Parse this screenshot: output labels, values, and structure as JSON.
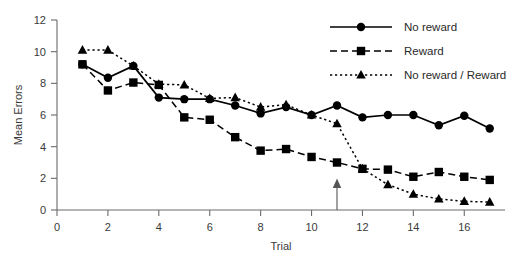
{
  "chart_data": {
    "type": "line",
    "title": "",
    "xlabel": "Trial",
    "ylabel": "Mean Errors",
    "xlim": [
      0,
      17.6
    ],
    "ylim": [
      0,
      12
    ],
    "xticks": [
      0,
      2,
      4,
      6,
      8,
      10,
      12,
      14,
      16
    ],
    "yticks": [
      0,
      2,
      4,
      6,
      8,
      10,
      12
    ],
    "xtick_labels": [
      "0",
      "2",
      "4",
      "6",
      "8",
      "10",
      "12",
      "14",
      "16"
    ],
    "ytick_labels": [
      "0",
      "2",
      "4",
      "6",
      "8",
      "10",
      "12"
    ],
    "grid": false,
    "legend_position": "top-right",
    "x": [
      1,
      2,
      3,
      4,
      5,
      6,
      7,
      8,
      9,
      10,
      11,
      12,
      13,
      14,
      15,
      16,
      17
    ],
    "series": [
      {
        "name": "No reward",
        "marker": "circle",
        "linestyle": "solid",
        "color": "#000000",
        "values": [
          9.2,
          8.35,
          9.1,
          7.1,
          7.0,
          7.0,
          6.6,
          6.1,
          6.5,
          6.0,
          6.6,
          5.85,
          6.0,
          6.0,
          5.35,
          5.95,
          5.15
        ]
      },
      {
        "name": "Reward",
        "marker": "square",
        "linestyle": "dashed",
        "color": "#000000",
        "values": [
          9.2,
          7.55,
          8.05,
          7.9,
          5.85,
          5.7,
          4.6,
          3.75,
          3.85,
          3.35,
          3.0,
          2.6,
          2.55,
          2.1,
          2.4,
          2.1,
          1.9
        ]
      },
      {
        "name": "No reward / Reward",
        "marker": "triangle",
        "linestyle": "dotted",
        "color": "#000000",
        "values": [
          10.1,
          10.1,
          9.1,
          7.95,
          7.9,
          7.05,
          7.1,
          6.5,
          6.65,
          6.0,
          5.45,
          2.6,
          1.6,
          1.0,
          0.7,
          0.55,
          0.5
        ]
      }
    ],
    "annotations": [
      {
        "type": "arrow",
        "name": "reversal-arrow",
        "x": 11,
        "y_from": 0,
        "y_to": 1.9,
        "label": ""
      }
    ]
  },
  "legend": {
    "items": [
      {
        "label": "No reward",
        "marker": "circle",
        "linestyle": "solid"
      },
      {
        "label": "Reward",
        "marker": "square",
        "linestyle": "dashed"
      },
      {
        "label": "No reward / Reward",
        "marker": "triangle",
        "linestyle": "dotted"
      }
    ]
  }
}
